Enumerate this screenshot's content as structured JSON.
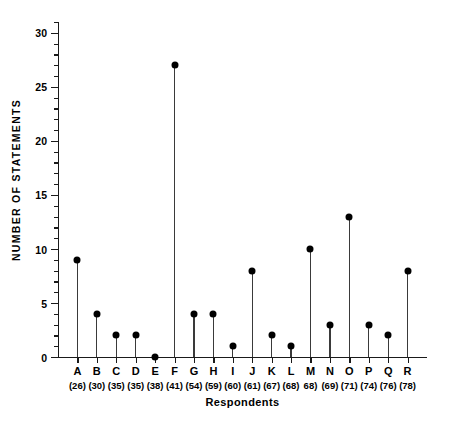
{
  "chart_data": {
    "type": "scatter",
    "plot_style": "stem-lollipop",
    "title": "",
    "xlabel": "Respondents",
    "ylabel": "NUMBER OF STATEMENTS",
    "categories": [
      "A",
      "B",
      "C",
      "D",
      "E",
      "F",
      "G",
      "H",
      "I",
      "J",
      "K",
      "L",
      "M",
      "N",
      "O",
      "P",
      "Q",
      "R"
    ],
    "category_sublabels": [
      "(26)",
      "(30)",
      "(35)",
      "(35)",
      "(38)",
      "(41)",
      "(54)",
      "(59)",
      "(60)",
      "(61)",
      "(67)",
      "(68)",
      "68)",
      "(69)",
      "(71)",
      "(74)",
      "(76)",
      "(78)"
    ],
    "values": [
      9,
      4,
      2,
      2,
      0,
      27,
      4,
      4,
      1,
      8,
      2,
      1,
      10,
      3,
      13,
      3,
      2,
      8
    ],
    "ylim": [
      0,
      31
    ],
    "ytick_labels": [
      "0",
      "5",
      "10",
      "15",
      "20",
      "25",
      "30"
    ],
    "ytick_values": [
      0,
      5,
      10,
      15,
      20,
      25,
      30
    ],
    "yminor_interval": 1,
    "grid": false,
    "legend": null,
    "marker_color": "#000000",
    "stem_color": "#3a3a3a",
    "axis_color": "#1a1a1a",
    "background_color": "#ffffff"
  }
}
